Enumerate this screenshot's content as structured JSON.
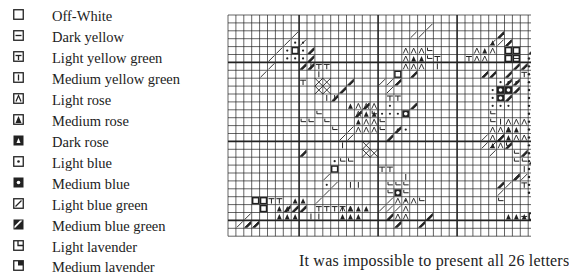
{
  "legend": {
    "items": [
      {
        "symbol": "empty-square-icon",
        "label": "Off-White"
      },
      {
        "symbol": "horizontal-bar-square-icon",
        "label": "Dark yellow"
      },
      {
        "symbol": "t-bar-square-icon",
        "label": "Light yellow green"
      },
      {
        "symbol": "vertical-bar-square-icon",
        "label": "Medium yellow green"
      },
      {
        "symbol": "caret-square-icon",
        "label": "Light rose"
      },
      {
        "symbol": "filled-triangle-square-icon",
        "label": "Medium rose"
      },
      {
        "symbol": "inverted-triangle-square-icon",
        "label": "Dark rose"
      },
      {
        "symbol": "dot-square-icon",
        "label": "Light blue"
      },
      {
        "symbol": "filled-dot-square-icon",
        "label": "Medium blue"
      },
      {
        "symbol": "slash-square-icon",
        "label": "Light blue green"
      },
      {
        "symbol": "filled-slash-square-icon",
        "label": "Medium blue green"
      },
      {
        "symbol": "corner-square-icon",
        "label": "Light lavender"
      },
      {
        "symbol": "filled-corner-square-icon",
        "label": "Medium lavender"
      }
    ]
  },
  "chart": {
    "grid_color": "#222222",
    "background": "#ffffff"
  },
  "caption": {
    "text": "It was impossible to present all 26 letters"
  }
}
